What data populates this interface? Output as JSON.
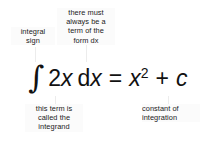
{
  "figure": {
    "background_color": "#ffffff",
    "text_color": "#1a1a1a",
    "equation_color": "#111111",
    "leader_line_color": "#ececec"
  },
  "annotations": {
    "integral_sign": "integral\nsign",
    "dx_term": "there must\nalways be a\nterm of the\nform dx",
    "integrand": "this term is\ncalled the\nintegrand",
    "constant_of_integration": "constant of\nintegration"
  },
  "equation": {
    "full_text": "∫ 2x dx = x² + c",
    "integral_symbol": "∫",
    "coefficient": "2",
    "variable": "x",
    "differential_d": "d",
    "differential_variable": "x",
    "equals": "=",
    "result_variable": "x",
    "result_exponent": "2",
    "plus": "+",
    "constant": "c"
  }
}
